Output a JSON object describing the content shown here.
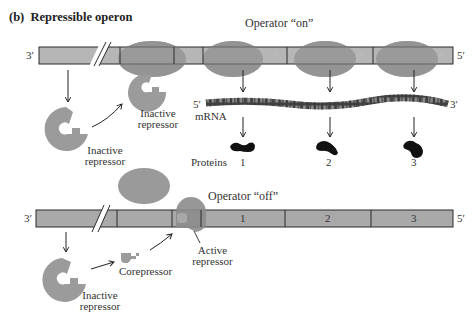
{
  "panel": {
    "label": "(b)",
    "title": "Repressible operon"
  },
  "top": {
    "operator_state": "Operator “on”",
    "dna_end_left": "3′",
    "dna_end_right": "5′",
    "repressor_gene_product": "Inactive repressor",
    "repressor_near_operator": "Inactive repressor",
    "mrna": {
      "end_left": "5′",
      "end_right": "3′",
      "label": "mRNA"
    },
    "proteins_label": "Proteins",
    "proteins": [
      "1",
      "2",
      "3"
    ]
  },
  "bottom": {
    "operator_state": "Operator “off”",
    "dna_end_left": "3′",
    "dna_end_right": "5′",
    "repressor_gene_product": "Inactive repressor",
    "corepressor": "Corepressor",
    "active_repressor": "Active repressor",
    "genes": [
      "1",
      "2",
      "3"
    ]
  },
  "colors": {
    "dna_fill": "#a9a9a9",
    "dna_stroke": "#2b2b2b",
    "polymerase": "#9a9a9a",
    "repressor": "#9b9b9b",
    "protein": "#111111",
    "mrna": "#4a4a4a"
  }
}
